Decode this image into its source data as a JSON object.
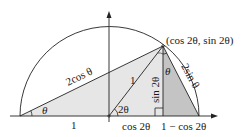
{
  "diagram": {
    "point_label": "(cos 2θ, sin 2θ)",
    "labels": {
      "hyp_left": "2cos θ",
      "radius": "1",
      "height": "sin 2θ",
      "chord_right": "2sin θ",
      "angle_left": "θ",
      "angle_center": "2θ",
      "angle_top": "θ",
      "base_left": "1",
      "base_mid": "cos 2θ",
      "base_right": "1 − cos 2θ"
    },
    "colors": {
      "light_fill": "#e6e6e6",
      "dark_fill": "#c4c4c4",
      "stroke": "#222222"
    }
  }
}
